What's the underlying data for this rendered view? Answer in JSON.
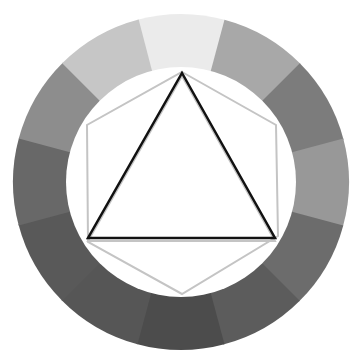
{
  "diagram": {
    "type": "color-wheel-harmony",
    "background": "#ffffff",
    "wheel": {
      "center": [
        181,
        182
      ],
      "outer_radius": 168,
      "inner_radius": 115,
      "segment_count": 12,
      "start_angle_deg": -105,
      "segments": [
        {
          "index": 0,
          "position": "12 o'clock",
          "color": "#ebebeb"
        },
        {
          "index": 1,
          "position": "1 o'clock",
          "color": "#a8a8a8"
        },
        {
          "index": 2,
          "position": "2 o'clock",
          "color": "#7c7c7c"
        },
        {
          "index": 3,
          "position": "3 o'clock",
          "color": "#989898"
        },
        {
          "index": 4,
          "position": "4 o'clock",
          "color": "#6c6c6c"
        },
        {
          "index": 5,
          "position": "5 o'clock",
          "color": "#5c5c5c"
        },
        {
          "index": 6,
          "position": "6 o'clock",
          "color": "#4c4c4c"
        },
        {
          "index": 7,
          "position": "7 o'clock",
          "color": "#565656"
        },
        {
          "index": 8,
          "position": "8 o'clock",
          "color": "#595959"
        },
        {
          "index": 9,
          "position": "9 o'clock",
          "color": "#686868"
        },
        {
          "index": 10,
          "position": "10 o'clock",
          "color": "#8d8d8d"
        },
        {
          "index": 11,
          "position": "11 o'clock",
          "color": "#c6c6c6"
        }
      ]
    },
    "hexagon": {
      "stroke": "#c4c4c4",
      "stroke_width": 2,
      "points": [
        [
          182,
          72
        ],
        [
          276,
          125
        ],
        [
          278,
          236
        ],
        [
          182,
          294
        ],
        [
          88,
          242
        ],
        [
          87,
          125
        ]
      ]
    },
    "triangle": {
      "stroke": "#111111",
      "stroke_width": 2.5,
      "shadow_stroke": "#c4c4c4",
      "points": [
        [
          182,
          73
        ],
        [
          275,
          238
        ],
        [
          88,
          238
        ]
      ]
    }
  }
}
